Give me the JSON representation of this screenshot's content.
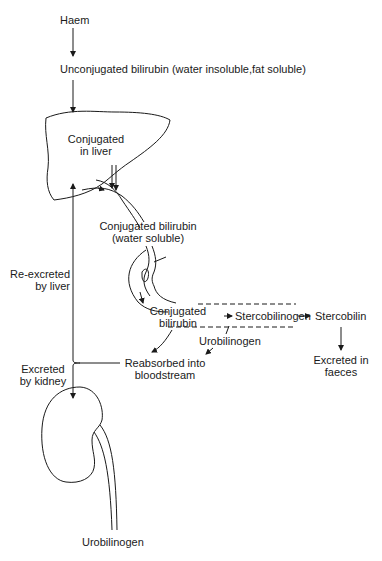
{
  "diagram": {
    "nodes": {
      "haem": "Haem",
      "unconjugated": "Unconjugated bilirubin (water insoluble,fat soluble)",
      "liver_line1": "Conjugated",
      "liver_line2": "in liver",
      "conj_water_line1": "Conjugated bilirubin",
      "conj_water_line2": "(water soluble)",
      "gut_conj_line1": "Conjugated",
      "gut_conj_line2": "bilirubin",
      "stercobilinogen": "Stercobilinogen",
      "stercobilin": "Stercobilin",
      "faeces_line1": "Excreted in",
      "faeces_line2": "faeces",
      "urobilinogen_gut": "Urobilinogen",
      "reabsorbed_line1": "Reabsorbed into",
      "reabsorbed_line2": "bloodstream",
      "reexcreted_line1": "Re-excreted",
      "reexcreted_line2": "by liver",
      "kidney_line1": "Excreted",
      "kidney_line2": "by kidney",
      "urobilinogen_urine": "Urobilinogen"
    },
    "organs": [
      "liver",
      "gallbladder-bile-duct",
      "intestine",
      "kidney",
      "ureter"
    ],
    "stroke_color": "#1a1a1a",
    "background_color": "#ffffff"
  }
}
